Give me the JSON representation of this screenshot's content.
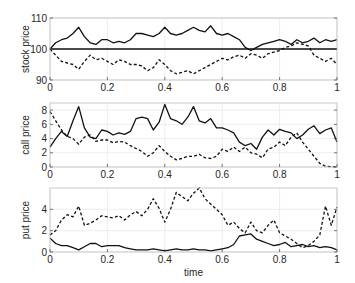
{
  "chart_data": [
    {
      "type": "line",
      "title": "",
      "xlabel": "",
      "ylabel": "stock price",
      "xlim": [
        0,
        1
      ],
      "ylim": [
        90,
        110
      ],
      "xticks": [
        "0",
        "0.2",
        "0.4",
        "0.6",
        "0.8",
        "1"
      ],
      "yticks": [
        "90",
        "100",
        "110"
      ],
      "grid": true,
      "series": [
        {
          "name": "stock path (up)",
          "style": "solid",
          "x": [
            0,
            0.02,
            0.04,
            0.06,
            0.08,
            0.1,
            0.12,
            0.14,
            0.16,
            0.18,
            0.2,
            0.22,
            0.24,
            0.26,
            0.28,
            0.3,
            0.32,
            0.34,
            0.36,
            0.38,
            0.4,
            0.42,
            0.44,
            0.46,
            0.48,
            0.5,
            0.52,
            0.54,
            0.56,
            0.58,
            0.6,
            0.62,
            0.64,
            0.66,
            0.68,
            0.7,
            0.72,
            0.74,
            0.76,
            0.78,
            0.8,
            0.82,
            0.84,
            0.86,
            0.88,
            0.9,
            0.92,
            0.94,
            0.96,
            0.98,
            1.0
          ],
          "values": [
            100,
            102,
            103,
            103.5,
            105,
            107,
            104,
            102,
            101.5,
            103,
            103,
            102,
            102.5,
            102,
            103,
            105,
            105,
            104.5,
            104,
            105,
            107,
            105,
            104.5,
            105,
            106,
            107,
            106,
            105.5,
            107.5,
            105,
            104.5,
            105,
            104,
            103,
            100.5,
            99.5,
            100.5,
            101.5,
            102,
            102.5,
            103,
            102.5,
            101.5,
            103,
            102,
            102.5,
            103.5,
            102,
            103,
            102.5,
            103
          ]
        },
        {
          "name": "stock path (down)",
          "style": "dashed",
          "x": [
            0,
            0.02,
            0.04,
            0.06,
            0.08,
            0.1,
            0.12,
            0.14,
            0.16,
            0.18,
            0.2,
            0.22,
            0.24,
            0.26,
            0.28,
            0.3,
            0.32,
            0.34,
            0.36,
            0.38,
            0.4,
            0.42,
            0.44,
            0.46,
            0.48,
            0.5,
            0.52,
            0.54,
            0.56,
            0.58,
            0.6,
            0.62,
            0.64,
            0.66,
            0.68,
            0.7,
            0.72,
            0.74,
            0.76,
            0.78,
            0.8,
            0.82,
            0.84,
            0.86,
            0.88,
            0.9,
            0.92,
            0.94,
            0.96,
            0.98,
            1.0
          ],
          "values": [
            100,
            98,
            96,
            95.5,
            95,
            93.5,
            96,
            98,
            96.5,
            97,
            96,
            95,
            96.5,
            96,
            95,
            95,
            94.5,
            93,
            94,
            96.5,
            95,
            93,
            92,
            92.5,
            93,
            92,
            93,
            94,
            95,
            96,
            97,
            96.5,
            97.5,
            98,
            97,
            98.5,
            98,
            97,
            98.5,
            99,
            99.5,
            100.5,
            101,
            102,
            101.5,
            101,
            98,
            97,
            96,
            97,
            95
          ]
        },
        {
          "name": "strike",
          "style": "solid-bold",
          "x": [
            0,
            1
          ],
          "values": [
            100,
            100
          ]
        }
      ]
    },
    {
      "type": "line",
      "title": "",
      "xlabel": "",
      "ylabel": "call price",
      "xlim": [
        0,
        1
      ],
      "ylim": [
        0,
        9
      ],
      "xticks": [
        "0",
        "0.2",
        "0.4",
        "0.6",
        "0.8",
        "1"
      ],
      "yticks": [
        "0",
        "2",
        "4",
        "6",
        "8"
      ],
      "grid": true,
      "series": [
        {
          "name": "call (up path)",
          "style": "solid",
          "x": [
            0,
            0.02,
            0.04,
            0.06,
            0.08,
            0.1,
            0.12,
            0.14,
            0.16,
            0.18,
            0.2,
            0.22,
            0.24,
            0.26,
            0.28,
            0.3,
            0.32,
            0.34,
            0.36,
            0.38,
            0.4,
            0.42,
            0.44,
            0.46,
            0.48,
            0.5,
            0.52,
            0.54,
            0.56,
            0.58,
            0.6,
            0.62,
            0.64,
            0.66,
            0.68,
            0.7,
            0.72,
            0.74,
            0.76,
            0.78,
            0.8,
            0.82,
            0.84,
            0.86,
            0.88,
            0.9,
            0.92,
            0.94,
            0.96,
            0.98,
            1.0
          ],
          "values": [
            2.8,
            4,
            5,
            4.3,
            6.5,
            8.5,
            5.5,
            4.2,
            4,
            5.2,
            5,
            4.5,
            4.8,
            4.6,
            5,
            6.8,
            7,
            6.8,
            5.2,
            6.3,
            8.8,
            6.8,
            6.5,
            6,
            7,
            8.5,
            6.5,
            6.2,
            6.8,
            5.5,
            5.5,
            5.2,
            4.8,
            3.5,
            3,
            3.3,
            2.5,
            4.2,
            5.2,
            4.5,
            5.3,
            5,
            4.8,
            4,
            4.5,
            5.3,
            5.8,
            4.7,
            5.2,
            5.5,
            3.5
          ]
        },
        {
          "name": "call (down path)",
          "style": "dashed",
          "x": [
            0,
            0.02,
            0.04,
            0.06,
            0.08,
            0.1,
            0.12,
            0.14,
            0.16,
            0.18,
            0.2,
            0.22,
            0.24,
            0.26,
            0.28,
            0.3,
            0.32,
            0.34,
            0.36,
            0.38,
            0.4,
            0.42,
            0.44,
            0.46,
            0.48,
            0.5,
            0.52,
            0.54,
            0.56,
            0.58,
            0.6,
            0.62,
            0.64,
            0.66,
            0.68,
            0.7,
            0.72,
            0.74,
            0.76,
            0.78,
            0.8,
            0.82,
            0.84,
            0.86,
            0.88,
            0.9,
            0.92,
            0.94,
            0.96,
            0.98,
            1.0
          ],
          "values": [
            7.8,
            6.5,
            5.2,
            4.3,
            4,
            3.2,
            4.2,
            4.5,
            3.6,
            3.8,
            3.8,
            3.4,
            3.6,
            3.5,
            3,
            2.6,
            2.2,
            1.5,
            2,
            3,
            2.2,
            1.5,
            1,
            1.2,
            1.5,
            1.5,
            1.8,
            1.3,
            1.2,
            1.5,
            2.5,
            2.2,
            2.8,
            2.2,
            2.8,
            2,
            1.8,
            1.3,
            2.5,
            2.8,
            3.5,
            3,
            4.2,
            4.8,
            3.5,
            2.5,
            1.5,
            0.5,
            0.1,
            0.05,
            0
          ]
        }
      ]
    },
    {
      "type": "line",
      "title": "",
      "xlabel": "time",
      "ylabel": "put price",
      "xlim": [
        0,
        1
      ],
      "ylim": [
        0,
        6
      ],
      "xticks": [
        "0",
        "0.2",
        "0.4",
        "0.6",
        "0.8",
        "1"
      ],
      "yticks": [
        "0",
        "2",
        "4"
      ],
      "grid": true,
      "series": [
        {
          "name": "put (up path)",
          "style": "solid",
          "x": [
            0,
            0.02,
            0.04,
            0.06,
            0.08,
            0.1,
            0.12,
            0.14,
            0.16,
            0.18,
            0.2,
            0.22,
            0.24,
            0.26,
            0.28,
            0.3,
            0.32,
            0.34,
            0.36,
            0.38,
            0.4,
            0.42,
            0.44,
            0.46,
            0.48,
            0.5,
            0.52,
            0.54,
            0.56,
            0.58,
            0.6,
            0.62,
            0.64,
            0.66,
            0.68,
            0.7,
            0.72,
            0.74,
            0.76,
            0.78,
            0.8,
            0.82,
            0.84,
            0.86,
            0.88,
            0.9,
            0.92,
            0.94,
            0.96,
            0.98,
            1.0
          ],
          "values": [
            1.3,
            0.8,
            0.6,
            0.6,
            0.4,
            0.2,
            0.5,
            0.8,
            0.8,
            0.5,
            0.6,
            0.6,
            0.6,
            0.4,
            0.3,
            0.2,
            0.2,
            0.2,
            0.3,
            0.2,
            0.1,
            0.2,
            0.3,
            0.2,
            0.2,
            0.3,
            0.2,
            0.2,
            0.1,
            0.2,
            0.3,
            0.4,
            0.7,
            1.5,
            1.6,
            1.7,
            1.2,
            1.0,
            0.8,
            0.6,
            0.7,
            0.9,
            0.5,
            0.6,
            0.7,
            0.5,
            0.6,
            0.4,
            0.5,
            0.4,
            0.2
          ]
        },
        {
          "name": "put (down path)",
          "style": "dashed",
          "x": [
            0,
            0.02,
            0.04,
            0.06,
            0.08,
            0.1,
            0.12,
            0.14,
            0.16,
            0.18,
            0.2,
            0.22,
            0.24,
            0.26,
            0.28,
            0.3,
            0.32,
            0.34,
            0.36,
            0.38,
            0.4,
            0.42,
            0.44,
            0.46,
            0.48,
            0.5,
            0.52,
            0.54,
            0.56,
            0.58,
            0.6,
            0.62,
            0.64,
            0.66,
            0.68,
            0.7,
            0.72,
            0.74,
            0.76,
            0.78,
            0.8,
            0.82,
            0.84,
            0.86,
            0.88,
            0.9,
            0.92,
            0.94,
            0.96,
            0.98,
            1.0
          ],
          "values": [
            1.6,
            2,
            3,
            3.5,
            3.3,
            4.3,
            2.5,
            2.7,
            3,
            3.4,
            3.3,
            3.2,
            3.4,
            3.0,
            3.5,
            3.8,
            3.4,
            4,
            5,
            4.1,
            2.8,
            4,
            5.6,
            5.2,
            4.8,
            5.5,
            6.0,
            5.0,
            4.5,
            4.0,
            3.5,
            2.5,
            2.8,
            2.2,
            1.8,
            2.8,
            2.0,
            1.8,
            2.5,
            3.0,
            1.8,
            1.5,
            1.2,
            0.8,
            0.4,
            0.6,
            1.0,
            1.6,
            4.3,
            2.5,
            4.2
          ]
        }
      ]
    }
  ],
  "labels": {
    "panel1_ylabel": "stock price",
    "panel2_ylabel": "call price",
    "panel3_ylabel": "put price",
    "xlabel": "time"
  }
}
